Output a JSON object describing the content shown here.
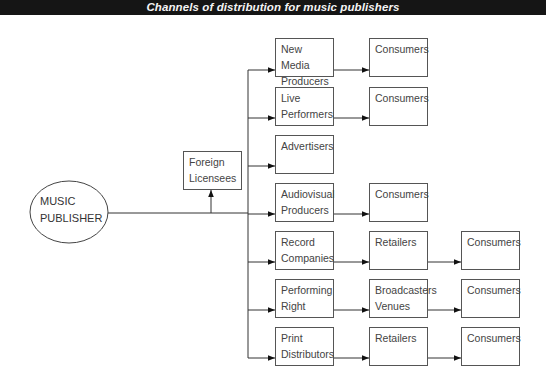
{
  "title": "Channels of distribution for music publishers",
  "source": {
    "label": "MUSIC\nPUBLISHER"
  },
  "foreign": {
    "label": "Foreign\nLicensees"
  },
  "rows": [
    {
      "col1": "New Media\nProducers",
      "col2": "Consumers",
      "col3": null
    },
    {
      "col1": "Live\nPerformers",
      "col2": "Consumers",
      "col3": null
    },
    {
      "col1": "Advertisers",
      "col2": null,
      "col3": null
    },
    {
      "col1": "Audiovisual\nProducers",
      "col2": "Consumers",
      "col3": null
    },
    {
      "col1": "Record\nCompanies",
      "col2": "Retailers",
      "col3": "Consumers"
    },
    {
      "col1": "Performing\nRight",
      "col2": "Broadcasters\nVenues",
      "col3": "Consumers"
    },
    {
      "col1": "Print\nDistributors",
      "col2": "Retailers",
      "col3": "Consumers"
    }
  ],
  "colors": {
    "title_bg": "#151515",
    "title_fg": "#f4f4f4",
    "line": "#333333",
    "box_border": "#555555"
  }
}
